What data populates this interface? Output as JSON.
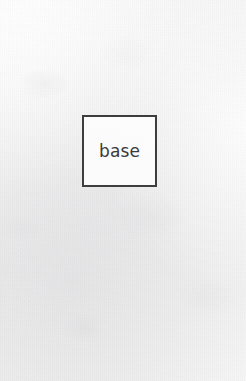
{
  "canvas": {
    "width": 246,
    "height": 381,
    "medium": "scanned-paper",
    "background_color": "#f4f4f4"
  },
  "diagram": {
    "nodes": [
      {
        "id": "base",
        "label": "base",
        "shape": "square",
        "x": 82,
        "y": 115,
        "width": 75,
        "height": 72,
        "border_color": "#3d3d3d",
        "border_width": 2,
        "fill_color": "#fdfdfd",
        "text_color": "#3a3a3a"
      }
    ],
    "edges": [],
    "annotations": []
  }
}
